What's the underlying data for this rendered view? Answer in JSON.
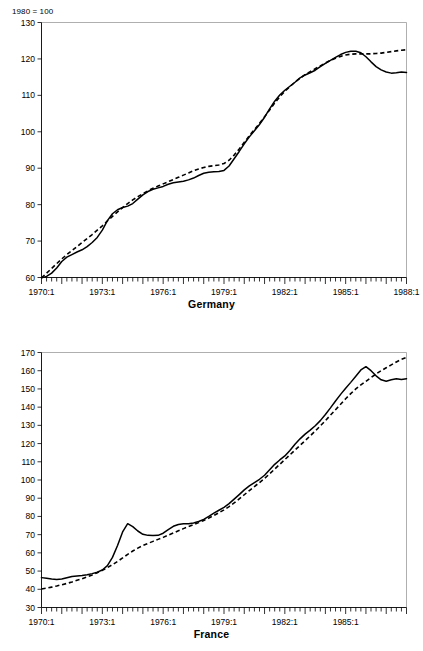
{
  "page": {
    "index_note": "1980 = 100"
  },
  "panels": [
    {
      "key": "germany",
      "title": "Germany"
    },
    {
      "key": "france",
      "title": "France"
    }
  ],
  "chart_data": [
    {
      "type": "line",
      "title": "Germany",
      "subtitle": "1980 = 100",
      "xlabel": "",
      "ylabel": "",
      "xlim": [
        "1970:1",
        "1988:1"
      ],
      "ylim": [
        60,
        130
      ],
      "ytick_labels": [
        60,
        70,
        80,
        90,
        100,
        110,
        120,
        130
      ],
      "xtick_labels": [
        "1970:1",
        "1973:1",
        "1976:1",
        "1979:1",
        "1982:1",
        "1985:1",
        "1988:1"
      ],
      "grid": false,
      "legend": "none",
      "frequency": "quarterly",
      "x": [
        "1970:1",
        "1970:2",
        "1970:3",
        "1970:4",
        "1971:1",
        "1971:2",
        "1971:3",
        "1971:4",
        "1972:1",
        "1972:2",
        "1972:3",
        "1972:4",
        "1973:1",
        "1973:2",
        "1973:3",
        "1973:4",
        "1974:1",
        "1974:2",
        "1974:3",
        "1974:4",
        "1975:1",
        "1975:2",
        "1975:3",
        "1975:4",
        "1976:1",
        "1976:2",
        "1976:3",
        "1976:4",
        "1977:1",
        "1977:2",
        "1977:3",
        "1977:4",
        "1978:1",
        "1978:2",
        "1978:3",
        "1978:4",
        "1979:1",
        "1979:2",
        "1979:3",
        "1979:4",
        "1980:1",
        "1980:2",
        "1980:3",
        "1980:4",
        "1981:1",
        "1981:2",
        "1981:3",
        "1981:4",
        "1982:1",
        "1982:2",
        "1982:3",
        "1982:4",
        "1983:1",
        "1983:2",
        "1983:3",
        "1983:4",
        "1984:1",
        "1984:2",
        "1984:3",
        "1984:4",
        "1985:1",
        "1985:2",
        "1985:3",
        "1985:4",
        "1986:1",
        "1986:2",
        "1986:3",
        "1986:4",
        "1987:1",
        "1987:2",
        "1987:3",
        "1987:4",
        "1988:1"
      ],
      "series": [
        {
          "name": "actual",
          "style": "solid",
          "values": [
            59.9,
            60.3,
            61.2,
            62.6,
            64.4,
            65.6,
            66.3,
            67.0,
            67.6,
            68.5,
            69.6,
            71.0,
            73.0,
            75.6,
            77.5,
            78.6,
            79.2,
            79.6,
            80.3,
            81.5,
            82.7,
            83.6,
            84.2,
            84.6,
            85.0,
            85.6,
            86.0,
            86.2,
            86.4,
            86.8,
            87.3,
            88.0,
            88.6,
            88.9,
            89.0,
            89.1,
            89.4,
            90.6,
            92.6,
            94.6,
            96.7,
            98.6,
            100.3,
            102.0,
            104.0,
            106.3,
            108.4,
            110.1,
            111.4,
            112.5,
            113.6,
            114.8,
            115.6,
            116.2,
            116.9,
            117.9,
            118.8,
            119.6,
            120.4,
            121.2,
            121.8,
            122.1,
            122.1,
            121.7,
            120.6,
            119.2,
            117.9,
            117.0,
            116.4,
            116.1,
            116.2,
            116.4,
            116.3
          ]
        },
        {
          "name": "fitted",
          "style": "dashed",
          "values": [
            59.9,
            61.2,
            62.5,
            63.8,
            65.1,
            66.3,
            67.4,
            68.5,
            69.6,
            70.7,
            71.8,
            73.0,
            74.2,
            75.5,
            76.8,
            78.0,
            79.2,
            80.3,
            81.3,
            82.2,
            83.0,
            83.8,
            84.5,
            85.1,
            85.7,
            86.3,
            86.9,
            87.5,
            88.1,
            88.7,
            89.3,
            89.8,
            90.2,
            90.5,
            90.7,
            90.9,
            91.3,
            92.2,
            93.6,
            95.3,
            97.1,
            98.9,
            100.6,
            102.3,
            104.1,
            106.0,
            107.9,
            109.6,
            111.1,
            112.4,
            113.6,
            114.7,
            115.7,
            116.5,
            117.3,
            118.1,
            118.9,
            119.6,
            120.2,
            120.7,
            121.1,
            121.3,
            121.4,
            121.4,
            121.4,
            121.4,
            121.5,
            121.6,
            121.8,
            122.0,
            122.2,
            122.4,
            122.5
          ]
        }
      ]
    },
    {
      "type": "line",
      "title": "France",
      "subtitle": "1980 = 100",
      "xlabel": "",
      "ylabel": "",
      "xlim": [
        "1970:1",
        "1988:1"
      ],
      "ylim": [
        30,
        170
      ],
      "ytick_labels": [
        30,
        40,
        50,
        60,
        70,
        80,
        90,
        100,
        110,
        120,
        130,
        140,
        150,
        160,
        170
      ],
      "xtick_labels": [
        "1970:1",
        "1973:1",
        "1976:1",
        "1979:1",
        "1982:1",
        "1985:1"
      ],
      "grid": false,
      "legend": "none",
      "frequency": "quarterly",
      "x": [
        "1970:1",
        "1970:2",
        "1970:3",
        "1970:4",
        "1971:1",
        "1971:2",
        "1971:3",
        "1971:4",
        "1972:1",
        "1972:2",
        "1972:3",
        "1972:4",
        "1973:1",
        "1973:2",
        "1973:3",
        "1973:4",
        "1974:1",
        "1974:2",
        "1974:3",
        "1974:4",
        "1975:1",
        "1975:2",
        "1975:3",
        "1975:4",
        "1976:1",
        "1976:2",
        "1976:3",
        "1976:4",
        "1977:1",
        "1977:2",
        "1977:3",
        "1977:4",
        "1978:1",
        "1978:2",
        "1978:3",
        "1978:4",
        "1979:1",
        "1979:2",
        "1979:3",
        "1979:4",
        "1980:1",
        "1980:2",
        "1980:3",
        "1980:4",
        "1981:1",
        "1981:2",
        "1981:3",
        "1981:4",
        "1982:1",
        "1982:2",
        "1982:3",
        "1982:4",
        "1983:1",
        "1983:2",
        "1983:3",
        "1983:4",
        "1984:1",
        "1984:2",
        "1984:3",
        "1984:4",
        "1985:1",
        "1985:2",
        "1985:3",
        "1985:4",
        "1986:1",
        "1986:2",
        "1986:3",
        "1986:4",
        "1987:1",
        "1987:2",
        "1987:3",
        "1987:4",
        "1988:1"
      ],
      "series": [
        {
          "name": "actual",
          "style": "solid",
          "values": [
            46.4,
            46.0,
            45.6,
            45.4,
            45.6,
            46.3,
            47.0,
            47.3,
            47.6,
            48.0,
            48.6,
            49.4,
            50.6,
            53.0,
            57.5,
            64.0,
            71.5,
            76.0,
            74.4,
            72.0,
            70.2,
            69.6,
            69.5,
            69.6,
            70.8,
            72.8,
            74.6,
            75.6,
            76.0,
            76.0,
            76.4,
            77.2,
            78.4,
            80.0,
            81.8,
            83.4,
            85.0,
            87.0,
            89.5,
            92.0,
            94.6,
            96.8,
            98.6,
            100.4,
            102.6,
            105.6,
            108.6,
            111.0,
            113.2,
            116.2,
            119.6,
            122.6,
            125.2,
            127.4,
            129.8,
            132.6,
            136.0,
            139.6,
            143.4,
            147.0,
            150.4,
            153.6,
            157.0,
            160.4,
            162.2,
            160.0,
            157.2,
            155.0,
            154.2,
            155.0,
            155.6,
            155.2,
            155.6
          ]
        },
        {
          "name": "fitted",
          "style": "dashed",
          "values": [
            40.2,
            40.6,
            41.2,
            41.8,
            42.5,
            43.2,
            44.0,
            44.9,
            45.8,
            46.8,
            47.9,
            49.1,
            50.4,
            51.9,
            53.5,
            55.3,
            57.2,
            59.2,
            61.0,
            62.6,
            64.0,
            65.2,
            66.3,
            67.4,
            68.5,
            69.7,
            70.9,
            72.1,
            73.3,
            74.4,
            75.5,
            76.6,
            77.8,
            79.1,
            80.5,
            82.0,
            83.6,
            85.4,
            87.4,
            89.6,
            91.9,
            94.2,
            96.4,
            98.6,
            100.9,
            103.4,
            106.0,
            108.6,
            111.2,
            113.8,
            116.4,
            119.0,
            121.6,
            124.2,
            126.9,
            129.7,
            132.6,
            135.6,
            138.6,
            141.6,
            144.6,
            147.4,
            150.0,
            152.2,
            154.2,
            156.2,
            158.2,
            160.0,
            161.6,
            163.2,
            164.8,
            166.2,
            167.3
          ]
        }
      ]
    }
  ]
}
